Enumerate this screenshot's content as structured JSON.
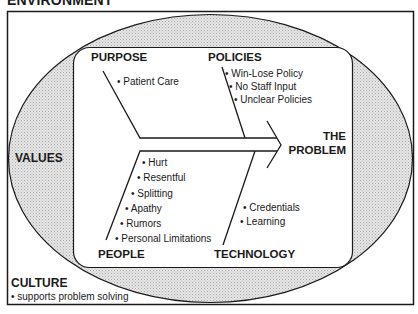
{
  "diagram": {
    "type": "fishbone",
    "title": "ENVIRONMENT",
    "effect": {
      "line1": "THE",
      "line2": "PROBLEM"
    },
    "categories": {
      "purpose": {
        "label": "PURPOSE",
        "items": [
          "• Patient Care"
        ]
      },
      "policies": {
        "label": "POLICIES",
        "items": [
          "• Win-Lose Policy",
          "• No Staff Input",
          "• Unclear Policies"
        ]
      },
      "people": {
        "label": "PEOPLE",
        "items": [
          "• Hurt",
          "• Resentful",
          "• Splitting",
          "• Apathy",
          "• Rumors",
          "• Personal Limitations"
        ]
      },
      "technology": {
        "label": "TECHNOLOGY",
        "items": [
          "• Credentials",
          "• Learning"
        ]
      }
    },
    "outer_layers": {
      "values": {
        "label": "VALUES"
      },
      "culture": {
        "label": "CULTURE",
        "items": [
          "• supports problem solving"
        ]
      }
    },
    "colors": {
      "line": "#1a1a1a",
      "ellipse_fill": "#d9d9d9",
      "inner_fill": "#ffffff",
      "background": "#ffffff"
    }
  }
}
